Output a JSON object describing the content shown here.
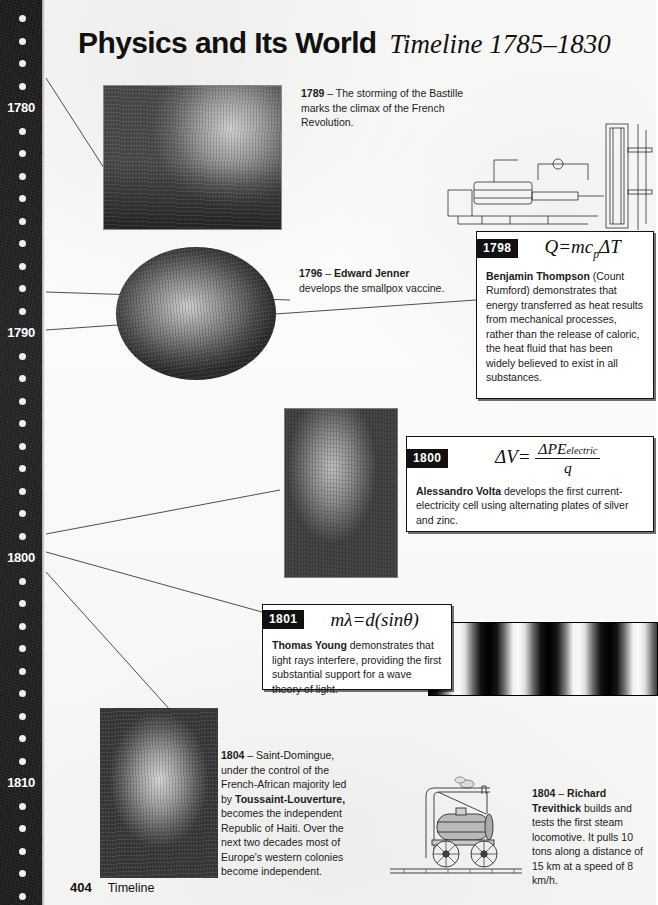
{
  "header": {
    "title_main": "Physics and Its World",
    "title_sub": "Timeline 1785–1830"
  },
  "timeline_rail": {
    "labels": [
      "1780",
      "1790",
      "1800",
      "1810"
    ],
    "decade_label_years": [
      1780,
      1790,
      1800,
      1810
    ],
    "start_year": 1776,
    "end_year": 1815,
    "dot_icon": "timeline-dot"
  },
  "entries": {
    "bastille": {
      "year": "1789",
      "dash": "–",
      "text": "The storming of the Bastille marks the climax of the French Revolution.",
      "image_name": "storming-of-the-bastille-engraving"
    },
    "jenner": {
      "year": "1796",
      "dash": "–",
      "lead": "Edward Jenner",
      "text": "develops the smallpox vaccine.",
      "image_name": "edward-jenner-vaccination-oval-portrait"
    },
    "thompson": {
      "year": "1798",
      "formula_plain": "Q = mc_p ΔT",
      "formula": {
        "q": "Q",
        "equals": "=",
        "mc": "mc",
        "sub": "p",
        "delta_t": "ΔT"
      },
      "lead": "Benjamin Thompson",
      "text": "(Count Rumford) demonstrates that energy transferred as heat results from mechanical processes, rather than the release of caloric, the heat fluid that has been widely believed to exist in all substances.",
      "image_name": "cannon-boring-machine-line-drawing"
    },
    "volta": {
      "year": "1800",
      "formula_plain": "ΔV = ΔPE_electric / q",
      "formula": {
        "lhs": "ΔV",
        "equals": "=",
        "numerator": "ΔPE",
        "numerator_sub": "electric",
        "denominator": "q"
      },
      "lead": "Alessandro Volta",
      "text": "develops the first current-electricity cell using alternating plates of silver and zinc.",
      "image_name": "alessandro-volta-in-laboratory-engraving"
    },
    "young": {
      "year": "1801",
      "formula_plain": "mλ = d(sin θ)",
      "formula": {
        "lhs_m": "m",
        "lhs_lambda": "λ",
        "equals": "=",
        "d": "d",
        "open": "(",
        "sin": "sin",
        "theta": "θ",
        "close": ")"
      },
      "lead": "Thomas Young",
      "text": "demonstrates that light rays interfere, providing the first substantial support for a wave theory of light.",
      "image_name": "double-slit-interference-fringes-photograph"
    },
    "haiti": {
      "year": "1804",
      "dash": "–",
      "text_part1": "Saint-Domingue, under the control of the French-African majority led by",
      "lead": "Toussaint-Louverture,",
      "text_part2": "becomes the independent Republic of Haiti. Over the next two decades most of Europe's western colonies become independent.",
      "image_name": "toussaint-louverture-portrait-engraving"
    },
    "trevithick": {
      "year": "1804",
      "dash": "–",
      "lead": "Richard Trevithick",
      "text": "builds and tests the first steam locomotive. It pulls 10 tons along a distance of 15 km at a speed of 8 km/h.",
      "image_name": "trevithick-steam-locomotive-line-drawing"
    }
  },
  "footer": {
    "page_number": "404",
    "section": "Timeline"
  },
  "colors": {
    "ink": "#111111",
    "paper": "#f8f8f6",
    "rail": "#1f1f1f",
    "badge_bg": "#111111",
    "badge_text": "#ffffff"
  }
}
